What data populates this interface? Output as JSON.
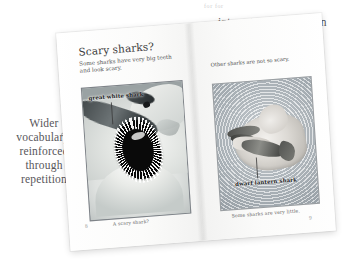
{
  "annotations": {
    "top": {
      "text": "interest and discussion",
      "ghost": "for for",
      "name": "annotation-interest-and-discussion"
    },
    "left": {
      "text": "Wider vocabulary, reinforced through repetition",
      "name": "annotation-wider-vocabulary"
    }
  },
  "book": {
    "left_page": {
      "heading": "Scary sharks?",
      "body": "Some sharks have very big teeth and look scary.",
      "photo_label": "great white shark",
      "caption": "A scary shark?",
      "folio": "8"
    },
    "right_page": {
      "body": "Other sharks are not so scary.",
      "photo_label": "dwarf lantern shark",
      "caption": "Some sharks are very little.",
      "folio": "9"
    }
  },
  "colors": {
    "page": "#fdfdfc",
    "ink": "#3b3b3b",
    "annotation_ink": "#57565a",
    "leader_line": "#8b8b8e",
    "background": "#ffffff"
  }
}
